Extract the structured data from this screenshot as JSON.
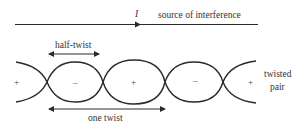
{
  "diagram": {
    "current_symbol": "I",
    "source_label": "source of interference",
    "half_twist_label": "half-twist",
    "one_twist_label": "one twist",
    "pair_label_line1": "twisted",
    "pair_label_line2": "pair",
    "signs": [
      "+",
      "–",
      "+",
      "–",
      "+"
    ],
    "stroke_color": "#2a2a2a"
  }
}
